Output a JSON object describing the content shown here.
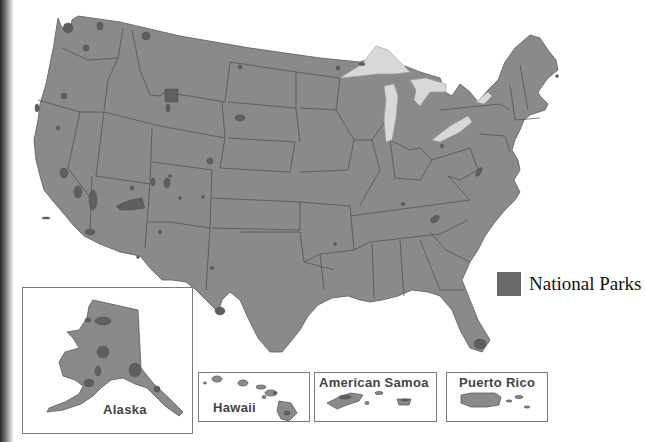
{
  "map": {
    "title": "United States National Parks",
    "colors": {
      "land": "#8a8a8a",
      "park": "#5f5f5f",
      "lake": "#d8d8d8",
      "border": "#4a4a4a",
      "legend_swatch": "#6a6a6a"
    },
    "legend": {
      "items": [
        {
          "label": "National Parks",
          "icon": "park-swatch"
        }
      ]
    },
    "insets": [
      {
        "id": "alaska",
        "label": "Alaska"
      },
      {
        "id": "hawaii",
        "label": "Hawaii"
      },
      {
        "id": "american-samoa",
        "label": "American Samoa"
      },
      {
        "id": "puerto-rico",
        "label": "Puerto Rico"
      }
    ]
  }
}
